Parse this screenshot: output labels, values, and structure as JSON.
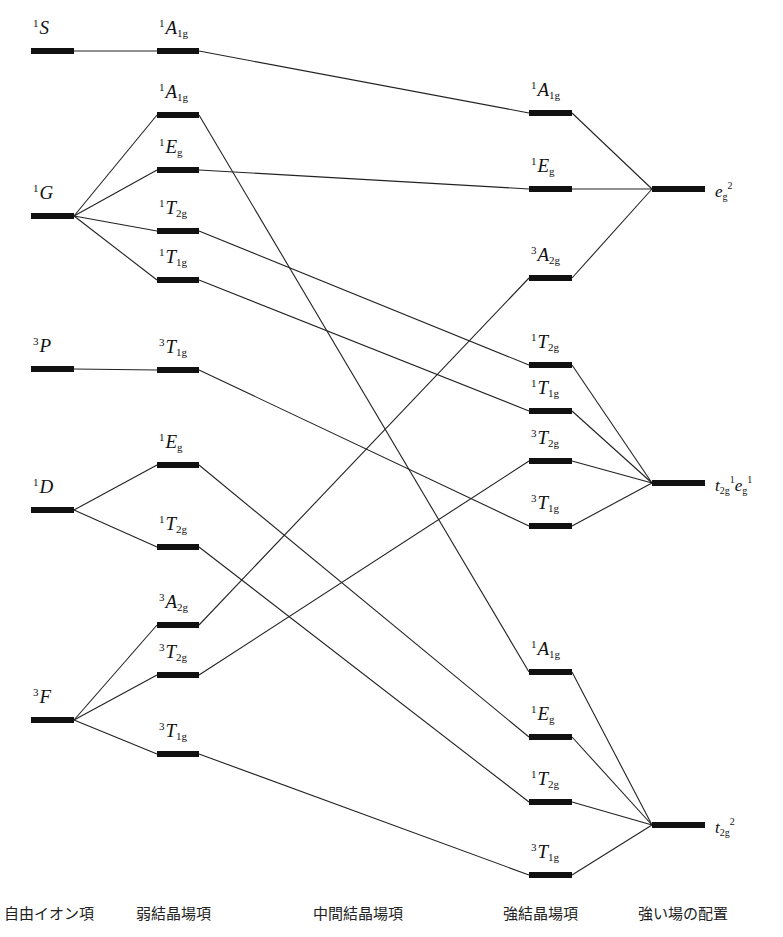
{
  "columns": {
    "free_ion": {
      "title": "自由イオン項",
      "x1": 31,
      "x2": 74,
      "title_x": 4
    },
    "weak": {
      "title": "弱結晶場項",
      "x1": 157,
      "x2": 199,
      "title_x": 136
    },
    "middle": {
      "title": "中間結晶場項",
      "title_x": 313
    },
    "strong": {
      "title": "強結晶場項",
      "x1": 529,
      "x2": 572,
      "title_x": 503
    },
    "config": {
      "title": "強い場の配置",
      "x1": 652,
      "x2": 705,
      "title_x": 638
    }
  },
  "levels": {
    "free_ion": [
      {
        "id": "F_1S",
        "mult": "1",
        "sym": "S",
        "sub": "",
        "y": 51
      },
      {
        "id": "F_1G",
        "mult": "1",
        "sym": "G",
        "sub": "",
        "y": 216
      },
      {
        "id": "F_3P",
        "mult": "3",
        "sym": "P",
        "sub": "",
        "y": 369
      },
      {
        "id": "F_1D",
        "mult": "1",
        "sym": "D",
        "sub": "",
        "y": 510
      },
      {
        "id": "F_3F",
        "mult": "3",
        "sym": "F",
        "sub": "",
        "y": 720
      }
    ],
    "weak": [
      {
        "id": "W_1A1g_S",
        "mult": "1",
        "sym": "A",
        "sub": "1g",
        "y": 51
      },
      {
        "id": "W_1A1g_G",
        "mult": "1",
        "sym": "A",
        "sub": "1g",
        "y": 115
      },
      {
        "id": "W_1Eg_G",
        "mult": "1",
        "sym": "E",
        "sub": "g",
        "y": 170
      },
      {
        "id": "W_1T2g_G",
        "mult": "1",
        "sym": "T",
        "sub": "2g",
        "y": 231
      },
      {
        "id": "W_1T1g_G",
        "mult": "1",
        "sym": "T",
        "sub": "1g",
        "y": 280
      },
      {
        "id": "W_3T1g_P",
        "mult": "3",
        "sym": "T",
        "sub": "1g",
        "y": 370
      },
      {
        "id": "W_1Eg_D",
        "mult": "1",
        "sym": "E",
        "sub": "g",
        "y": 465
      },
      {
        "id": "W_1T2g_D",
        "mult": "1",
        "sym": "T",
        "sub": "2g",
        "y": 547
      },
      {
        "id": "W_3A2g_F",
        "mult": "3",
        "sym": "A",
        "sub": "2g",
        "y": 625
      },
      {
        "id": "W_3T2g_F",
        "mult": "3",
        "sym": "T",
        "sub": "2g",
        "y": 675
      },
      {
        "id": "W_3T1g_F",
        "mult": "3",
        "sym": "T",
        "sub": "1g",
        "y": 754
      }
    ],
    "strong": [
      {
        "id": "S_1A1g_a",
        "mult": "1",
        "sym": "A",
        "sub": "1g",
        "y": 113
      },
      {
        "id": "S_1Eg_a",
        "mult": "1",
        "sym": "E",
        "sub": "g",
        "y": 189
      },
      {
        "id": "S_3A2g",
        "mult": "3",
        "sym": "A",
        "sub": "2g",
        "y": 278
      },
      {
        "id": "S_1T2g_b",
        "mult": "1",
        "sym": "T",
        "sub": "2g",
        "y": 365
      },
      {
        "id": "S_1T1g_b",
        "mult": "1",
        "sym": "T",
        "sub": "1g",
        "y": 411
      },
      {
        "id": "S_3T2g_b",
        "mult": "3",
        "sym": "T",
        "sub": "2g",
        "y": 461
      },
      {
        "id": "S_3T1g_b",
        "mult": "3",
        "sym": "T",
        "sub": "1g",
        "y": 526
      },
      {
        "id": "S_1A1g_c",
        "mult": "1",
        "sym": "A",
        "sub": "1g",
        "y": 672
      },
      {
        "id": "S_1Eg_c",
        "mult": "1",
        "sym": "E",
        "sub": "g",
        "y": 737
      },
      {
        "id": "S_1T2g_c",
        "mult": "1",
        "sym": "T",
        "sub": "2g",
        "y": 802
      },
      {
        "id": "S_3T1g_c",
        "mult": "3",
        "sym": "T",
        "sub": "1g",
        "y": 875
      }
    ],
    "config": [
      {
        "id": "C_eg2",
        "label_parts": [
          [
            "e",
            "g",
            "2"
          ]
        ],
        "y": 189
      },
      {
        "id": "C_t2geg",
        "label_parts": [
          [
            "t",
            "2g",
            "1"
          ],
          [
            "e",
            "g",
            "1"
          ]
        ],
        "y": 483
      },
      {
        "id": "C_t2g2",
        "label_parts": [
          [
            "t",
            "2g",
            "2"
          ]
        ],
        "y": 825
      }
    ]
  },
  "connections": [
    [
      "F_1S",
      "W_1A1g_S"
    ],
    [
      "F_1G",
      "W_1A1g_G"
    ],
    [
      "F_1G",
      "W_1Eg_G"
    ],
    [
      "F_1G",
      "W_1T2g_G"
    ],
    [
      "F_1G",
      "W_1T1g_G"
    ],
    [
      "F_3P",
      "W_3T1g_P"
    ],
    [
      "F_1D",
      "W_1Eg_D"
    ],
    [
      "F_1D",
      "W_1T2g_D"
    ],
    [
      "F_3F",
      "W_3A2g_F"
    ],
    [
      "F_3F",
      "W_3T2g_F"
    ],
    [
      "F_3F",
      "W_3T1g_F"
    ],
    [
      "W_1A1g_S",
      "S_1A1g_a"
    ],
    [
      "W_1A1g_G",
      "S_1A1g_c"
    ],
    [
      "W_1Eg_G",
      "S_1Eg_a"
    ],
    [
      "W_1T2g_G",
      "S_1T2g_b"
    ],
    [
      "W_1T1g_G",
      "S_1T1g_b"
    ],
    [
      "W_3T1g_P",
      "S_3T1g_b"
    ],
    [
      "W_1Eg_D",
      "S_1Eg_c"
    ],
    [
      "W_1T2g_D",
      "S_1T2g_c"
    ],
    [
      "W_3A2g_F",
      "S_3A2g"
    ],
    [
      "W_3T2g_F",
      "S_3T2g_b"
    ],
    [
      "W_3T1g_F",
      "S_3T1g_c"
    ],
    [
      "S_1A1g_a",
      "C_eg2"
    ],
    [
      "S_1Eg_a",
      "C_eg2"
    ],
    [
      "S_3A2g",
      "C_eg2"
    ],
    [
      "S_1T2g_b",
      "C_t2geg"
    ],
    [
      "S_1T1g_b",
      "C_t2geg"
    ],
    [
      "S_3T2g_b",
      "C_t2geg"
    ],
    [
      "S_3T1g_b",
      "C_t2geg"
    ],
    [
      "S_1A1g_c",
      "C_t2g2"
    ],
    [
      "S_1Eg_c",
      "C_t2g2"
    ],
    [
      "S_1T2g_c",
      "C_t2g2"
    ],
    [
      "S_3T1g_c",
      "C_t2g2"
    ]
  ],
  "style": {
    "bar_color": "#111111",
    "line_color": "#222222",
    "bar_thickness": 6,
    "line_width": 1.1
  }
}
